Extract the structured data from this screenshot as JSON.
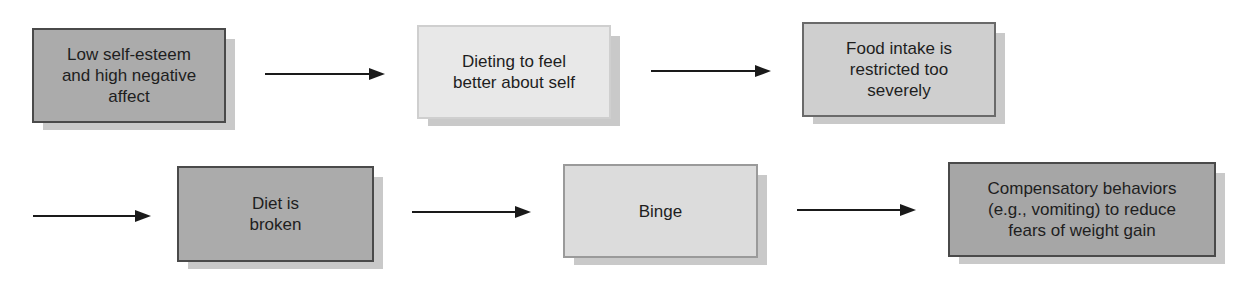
{
  "diagram": {
    "type": "flowchart",
    "nodes": [
      {
        "id": "n1",
        "label": "Low self-esteem\nand high negative\naffect",
        "fill": "#ababab"
      },
      {
        "id": "n2",
        "label": "Dieting to feel\nbetter about self",
        "fill": "#e8e8e8"
      },
      {
        "id": "n3",
        "label": "Food intake is\nrestricted too\nseverely",
        "fill": "#cfcfcf"
      },
      {
        "id": "n4",
        "label": "Diet is\nbroken",
        "fill": "#ababab"
      },
      {
        "id": "n5",
        "label": "Binge",
        "fill": "#dcdcdc"
      },
      {
        "id": "n6",
        "label": "Compensatory behaviors\n(e.g., vomiting) to reduce\nfears of weight gain",
        "fill": "#a6a6a6"
      }
    ],
    "edges": [
      {
        "from": "n1",
        "to": "n2"
      },
      {
        "from": "n2",
        "to": "n3"
      },
      {
        "from": "n3",
        "to": "n4"
      },
      {
        "from": "n4",
        "to": "n5"
      },
      {
        "from": "n5",
        "to": "n6"
      }
    ],
    "arrow_color": "#1a1a1a",
    "text_color": "#1e1e1e"
  }
}
